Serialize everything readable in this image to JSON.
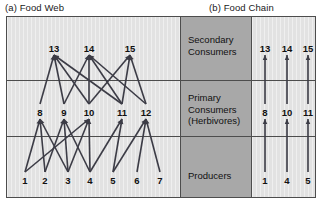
{
  "captions": {
    "a": "(a) Food Web",
    "b": "(b) Food Chain"
  },
  "tiers": [
    {
      "id": "secondary",
      "lines": [
        "Secondary",
        "Consumers"
      ]
    },
    {
      "id": "primary",
      "lines": [
        "Primary",
        "Consumers",
        "(Herbivores)"
      ]
    },
    {
      "id": "producers",
      "lines": [
        "Producers"
      ]
    }
  ],
  "colors": {
    "web_panel_bg": "#e2e2e2",
    "label_panel_bg": "#a8a8a8",
    "chain_panel_bg": "#e2e2e2",
    "border": "#4d4d4d",
    "link": "#3c3c46",
    "text": "#111111"
  },
  "food_web": {
    "secondary_consumers": [
      {
        "label": "13",
        "x": 54,
        "y": 48
      },
      {
        "label": "14",
        "x": 89,
        "y": 48
      },
      {
        "label": "15",
        "x": 130,
        "y": 48
      }
    ],
    "primary_consumers": [
      {
        "label": "8",
        "x": 40,
        "y": 112
      },
      {
        "label": "9",
        "x": 64,
        "y": 112
      },
      {
        "label": "10",
        "x": 89,
        "y": 112
      },
      {
        "label": "11",
        "x": 122,
        "y": 112
      },
      {
        "label": "12",
        "x": 146,
        "y": 112
      }
    ],
    "producers": [
      {
        "label": "1",
        "x": 25,
        "y": 180
      },
      {
        "label": "2",
        "x": 45,
        "y": 180
      },
      {
        "label": "3",
        "x": 68,
        "y": 180
      },
      {
        "label": "4",
        "x": 90,
        "y": 180
      },
      {
        "label": "5",
        "x": 113,
        "y": 180
      },
      {
        "label": "6",
        "x": 137,
        "y": 180
      },
      {
        "label": "7",
        "x": 160,
        "y": 180
      }
    ],
    "upper_links": [
      {
        "from": "13",
        "to": "8"
      },
      {
        "from": "13",
        "to": "9"
      },
      {
        "from": "13",
        "to": "10"
      },
      {
        "from": "13",
        "to": "11"
      },
      {
        "from": "14",
        "to": "9"
      },
      {
        "from": "14",
        "to": "10"
      },
      {
        "from": "14",
        "to": "11"
      },
      {
        "from": "14",
        "to": "12"
      },
      {
        "from": "15",
        "to": "10"
      },
      {
        "from": "15",
        "to": "11"
      },
      {
        "from": "15",
        "to": "12"
      }
    ],
    "lower_links": [
      {
        "from": "8",
        "to": "1"
      },
      {
        "from": "8",
        "to": "2"
      },
      {
        "from": "8",
        "to": "3"
      },
      {
        "from": "9",
        "to": "2"
      },
      {
        "from": "9",
        "to": "3"
      },
      {
        "from": "9",
        "to": "4"
      },
      {
        "from": "10",
        "to": "1"
      },
      {
        "from": "10",
        "to": "3"
      },
      {
        "from": "10",
        "to": "4"
      },
      {
        "from": "11",
        "to": "4"
      },
      {
        "from": "11",
        "to": "5"
      },
      {
        "from": "12",
        "to": "5"
      },
      {
        "from": "12",
        "to": "6"
      },
      {
        "from": "12",
        "to": "7"
      }
    ]
  },
  "food_chain": {
    "columns": [
      {
        "secondary": "13",
        "primary": "8",
        "producer": "1",
        "x": 265
      },
      {
        "secondary": "14",
        "primary": "10",
        "producer": "4",
        "x": 287
      },
      {
        "secondary": "15",
        "primary": "11",
        "producer": "5",
        "x": 308
      }
    ],
    "rows": {
      "secondary_y": 48,
      "primary_y": 112,
      "producer_y": 180
    }
  },
  "layout": {
    "web_panel": {
      "x": 6,
      "y": 16,
      "w": 175,
      "h": 182
    },
    "label_panel": {
      "x": 180,
      "y": 16,
      "w": 72,
      "h": 182
    },
    "chain_panel": {
      "x": 251,
      "y": 16,
      "w": 65,
      "h": 182
    },
    "divider_y": [
      80,
      136
    ]
  }
}
